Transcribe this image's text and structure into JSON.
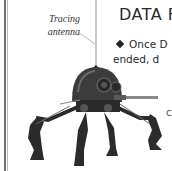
{
  "page": {
    "type": "book page scan",
    "callout": {
      "line1": "Tracing",
      "line2": "antenna"
    },
    "heading": "DATA F",
    "body": {
      "line1": "Once D",
      "line2": "ended, d",
      "bullet_icon": "diamond-bullet"
    },
    "stray_text": "c",
    "illustration": {
      "subject": "dwarf spider droid",
      "label_target": "antenna"
    },
    "colors": {
      "background": "#ffffff",
      "text": "#2a2a2a",
      "droid_dark": "#2b2b2b",
      "droid_mid": "#6a6a6a"
    }
  }
}
